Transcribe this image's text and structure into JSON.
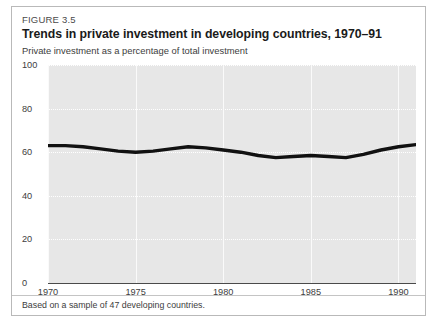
{
  "figure": {
    "number": "FIGURE 3.5",
    "title": "Trends in private investment in developing countries, 1970–91",
    "subtitle": "Private investment as a percentage of total investment",
    "footnote": "Based on a sample of 47 developing countries."
  },
  "colors": {
    "plot_background": "#e7e7e7",
    "gridline": "#ffffff",
    "vertical_gridline": "#fafafa",
    "series_line": "#111111",
    "axis": "#4a4a4a",
    "card_border": "#b9b9b9",
    "text": "#3d3d3d"
  },
  "chart_data": {
    "type": "line",
    "title": "Trends in private investment in developing countries, 1970–91",
    "subtitle": "Private investment as a percentage of total investment",
    "xlabel": "",
    "ylabel": "",
    "xlim": [
      1970,
      1991
    ],
    "ylim": [
      0,
      100
    ],
    "yticks": [
      0,
      20,
      40,
      60,
      80,
      100
    ],
    "ytick_labels": [
      "0",
      "20",
      "40",
      "60",
      "80",
      "100"
    ],
    "xticks": [
      1970,
      1975,
      1980,
      1985,
      1990
    ],
    "xtick_labels": [
      "1970",
      "1975",
      "1980",
      "1985",
      "1990"
    ],
    "grid": "horizontal-dotted-and-vertical-solid",
    "legend": "none",
    "x": [
      1970,
      1971,
      1972,
      1973,
      1974,
      1975,
      1976,
      1977,
      1978,
      1979,
      1980,
      1981,
      1982,
      1983,
      1984,
      1985,
      1986,
      1987,
      1988,
      1989,
      1990,
      1991
    ],
    "values": [
      63,
      63,
      62.5,
      61.5,
      60.5,
      60,
      60.5,
      61.5,
      62.5,
      62,
      61,
      60,
      58.5,
      57.5,
      58,
      58.5,
      58,
      57.5,
      59,
      61,
      62.5,
      63.5
    ],
    "series": [
      {
        "name": "Private investment as a percentage of total investment",
        "values": [
          63,
          63,
          62.5,
          61.5,
          60.5,
          60,
          60.5,
          61.5,
          62.5,
          62,
          61,
          60,
          58.5,
          57.5,
          58,
          58.5,
          58,
          57.5,
          59,
          61,
          62.5,
          63.5
        ]
      }
    ]
  }
}
